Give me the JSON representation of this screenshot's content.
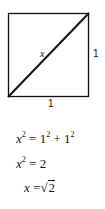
{
  "diagram": {
    "shape": "square with diagonal",
    "diagonal_label": "x",
    "side_right_label": "1",
    "side_bottom_label": "1"
  },
  "equations": [
    {
      "lhs_var": "x",
      "lhs_exp": "2",
      "eq": "=",
      "rhs": "1² + 1²",
      "r1": "1",
      "r1_exp": "2",
      "plus": "+",
      "r2": "1",
      "r2_exp": "2"
    },
    {
      "lhs_var": "x",
      "lhs_exp": "2",
      "eq": "=",
      "rhs": "2"
    },
    {
      "lhs_var": "x",
      "eq": "=",
      "radical": "√",
      "radicand": "2"
    }
  ]
}
